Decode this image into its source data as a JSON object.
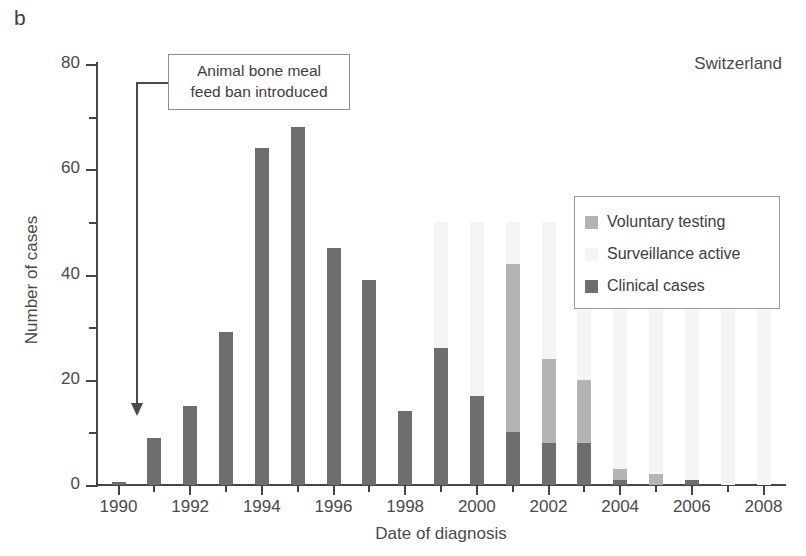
{
  "panel": {
    "letter": "b"
  },
  "country": {
    "label": "Switzerland"
  },
  "annotation": {
    "line1": "Animal bone meal",
    "line2": "feed ban introduced",
    "points_to_year": 1990.5
  },
  "axes": {
    "y_title": "Number of cases",
    "x_title": "Date of diagnosis",
    "y_ticks_major": [
      "0",
      "20",
      "40",
      "60",
      "80"
    ],
    "x_ticks_major": [
      "1990",
      "1992",
      "1994",
      "1996",
      "1998",
      "2000",
      "2002",
      "2004",
      "2006",
      "2008"
    ]
  },
  "legend": {
    "items": [
      {
        "label": "Voluntary testing",
        "color": "#b4b4b4"
      },
      {
        "label": "Surveillance active",
        "color": "#f4f4f4"
      },
      {
        "label": "Clinical cases",
        "color": "#6e6e6e"
      }
    ]
  },
  "chart_data": {
    "type": "bar",
    "title": "Switzerland",
    "subtitle": "",
    "xlabel": "Date of diagnosis",
    "ylabel": "Number of cases",
    "xlim": [
      1989.4,
      2008.6
    ],
    "ylim": [
      0,
      80
    ],
    "grid": false,
    "legend_position": "upper-right-inside",
    "stacked": true,
    "categories": [
      1990,
      1991,
      1992,
      1993,
      1994,
      1995,
      1996,
      1997,
      1998,
      1999,
      2000,
      2001,
      2002,
      2003,
      2004,
      2005,
      2006,
      2007,
      2008
    ],
    "series": [
      {
        "name": "Clinical cases",
        "color": "#6e6e6e",
        "values": [
          0.5,
          9,
          15,
          29,
          64,
          68,
          45,
          39,
          14,
          26,
          17,
          10,
          8,
          8,
          1,
          0,
          1,
          0,
          0
        ]
      },
      {
        "name": "Voluntary testing",
        "color": "#b4b4b4",
        "values": [
          0,
          0,
          0,
          0,
          0,
          0,
          0,
          0,
          0,
          0,
          0,
          32,
          16,
          12,
          2,
          2,
          0,
          0,
          0
        ]
      }
    ],
    "totals": [
      0.5,
      9,
      15,
      29,
      64,
      68,
      45,
      39,
      14,
      26,
      17,
      42,
      24,
      20,
      3,
      2,
      1,
      0,
      0
    ],
    "annotations": [
      {
        "text": "Animal bone meal feed ban introduced",
        "x": 1990.5,
        "y": 0,
        "style": "boxed-arrow"
      }
    ],
    "surveillance_active_years": [
      1999,
      2000,
      2001,
      2002,
      2003,
      2004,
      2005,
      2006,
      2007,
      2008
    ],
    "surveillance_active_band_max": 50
  }
}
